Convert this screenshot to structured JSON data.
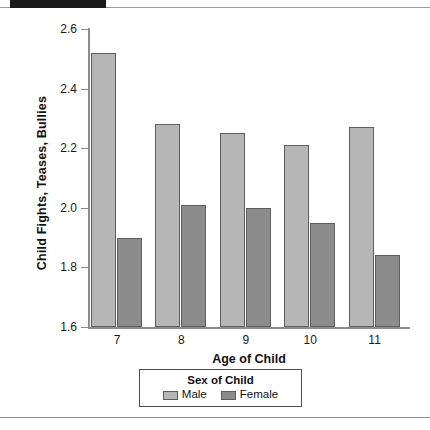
{
  "chart_data": {
    "type": "bar",
    "title": "",
    "xlabel": "Age of Child",
    "ylabel": "Child Fights, Teases, Bullies",
    "categories": [
      "7",
      "8",
      "9",
      "10",
      "11"
    ],
    "series": [
      {
        "name": "Male",
        "color": "#b6b6b6",
        "values": [
          2.52,
          2.28,
          2.25,
          2.21,
          2.27
        ]
      },
      {
        "name": "Female",
        "color": "#8c8c8c",
        "values": [
          1.9,
          2.01,
          2.0,
          1.95,
          1.84
        ]
      }
    ],
    "ylim": [
      1.6,
      2.6
    ],
    "yticks": [
      "2.6",
      "2.4",
      "2.2",
      "2.0",
      "1.8",
      "1.6"
    ],
    "ytick_values": [
      2.6,
      2.4,
      2.2,
      2.0,
      1.8,
      1.6
    ],
    "grid": false,
    "legend_position": "bottom-center",
    "legend_title": "Sex of Child"
  },
  "legend": {
    "title": "Sex of Child",
    "items": [
      {
        "label": "Male"
      },
      {
        "label": "Female"
      }
    ]
  },
  "axes": {
    "x_title": "Age of Child",
    "y_title": "Child Fights, Teases, Bullies"
  }
}
